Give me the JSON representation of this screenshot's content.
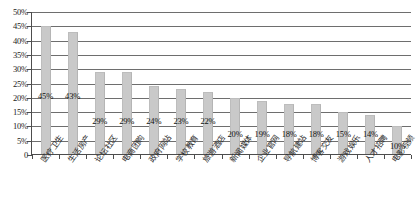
{
  "chart_data": {
    "type": "bar",
    "title": "",
    "subtitle": "",
    "xlabel": "",
    "ylabel": "",
    "ylim": [
      0,
      0.5
    ],
    "grid": true,
    "legend": "none",
    "orientation": "vertical",
    "value_format": "percent",
    "categories": [
      "医疗卫生",
      "生活房产",
      "论坛社区",
      "电商团购",
      "政府网站",
      "学校教育",
      "旅游酒店",
      "新闻媒体",
      "企业官网",
      "导航建站",
      "博客交友",
      "游戏娱乐",
      "人才招聘",
      "电影视频"
    ],
    "values": [
      45,
      43,
      29,
      29,
      24,
      23,
      22,
      20,
      19,
      18,
      18,
      15,
      14,
      10
    ],
    "value_labels": [
      "45%",
      "43%",
      "29%",
      "29%",
      "24%",
      "23%",
      "22%",
      "20%",
      "19%",
      "18%",
      "18%",
      "15%",
      "14%",
      "10%"
    ],
    "y_ticks": [
      0,
      5,
      10,
      15,
      20,
      25,
      30,
      35,
      40,
      45,
      50
    ],
    "y_tick_labels": [
      "0",
      "5%",
      "10%",
      "15%",
      "20%",
      "25%",
      "30%",
      "35%",
      "40%",
      "45%",
      "50%"
    ],
    "series": [
      {
        "name": "占比",
        "color": "#c9c9c9",
        "values": [
          45,
          43,
          29,
          29,
          24,
          23,
          22,
          20,
          19,
          18,
          18,
          15,
          14,
          10
        ]
      }
    ],
    "colors": {
      "bar": "#c9c9c9",
      "grid": "#6e6e6e",
      "axis": "#4d4d4d",
      "text": "#1a1a1a",
      "background": "#ffffff"
    }
  }
}
